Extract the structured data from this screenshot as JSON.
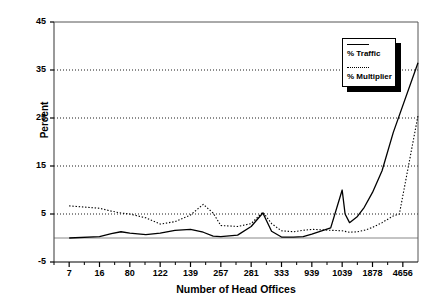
{
  "chart_data": {
    "type": "line",
    "title": "",
    "xlabel": "Number of Head Offices",
    "ylabel": "Percent",
    "ylim": [
      -5,
      45
    ],
    "yticks": [
      -5,
      5,
      15,
      25,
      35,
      45
    ],
    "grid": true,
    "grid_style": "dotted-horizontal",
    "legend_position": "top-right",
    "minor_ticks_per_interval": 2,
    "categories": [
      "7",
      "16",
      "80",
      "122",
      "139",
      "257",
      "281",
      "333",
      "939",
      "1039",
      "1878",
      "4656"
    ],
    "x_tick_labels": [
      "7",
      "16",
      "80",
      "122",
      "139",
      "257",
      "281",
      "333",
      "939",
      "1039",
      "1878",
      "4656"
    ],
    "series": [
      {
        "name": "% Traffic",
        "style": "solid",
        "color": "#000000",
        "x": [
          0,
          0.35,
          0.7,
          1.0,
          1.35,
          1.7,
          2.0,
          2.35,
          2.7,
          3.0,
          3.35,
          3.7,
          4.0,
          4.35,
          4.7,
          5.0,
          5.35,
          5.7,
          6.0,
          6.35,
          6.7,
          7.0,
          7.35,
          7.7,
          8.0,
          8.35,
          8.7,
          9.0,
          9.35,
          9.7,
          10.0,
          10.35,
          10.7,
          11.0,
          11.35
        ],
        "values": [
          0.0,
          0.0,
          0.1,
          0.2,
          0.5,
          0.8,
          1.0,
          1.2,
          1.3,
          1.1,
          0.8,
          0.6,
          0.9,
          1.3,
          1.6,
          1.8,
          1.4,
          0.9,
          0.5,
          0.2,
          0.2,
          0.4,
          1.6,
          4.3,
          5.3,
          1.4,
          0.2,
          0.2,
          0.2,
          0.4,
          0.9,
          1.4,
          2.0,
          2.4,
          2.6
        ]
      },
      {
        "name": "% Multiplier",
        "style": "dotted",
        "color": "#000000",
        "x": [
          0,
          0.35,
          0.7,
          1.0,
          1.35,
          1.7,
          2.0,
          2.35,
          2.7,
          3.0,
          3.35,
          3.7,
          4.0
        ],
        "values": [
          6.7,
          6.3,
          5.9,
          5.6,
          5.4,
          5.1,
          5.0,
          3.3,
          3.3,
          5.0,
          7.0,
          5.2,
          3.5
        ]
      }
    ],
    "traffic_points": [
      [
        7,
        0.0
      ],
      [
        16,
        0.3
      ],
      [
        30,
        0.9
      ],
      [
        50,
        1.3
      ],
      [
        80,
        1.0
      ],
      [
        100,
        0.7
      ],
      [
        122,
        1.0
      ],
      [
        130,
        1.6
      ],
      [
        139,
        1.8
      ],
      [
        180,
        1.2
      ],
      [
        220,
        0.4
      ],
      [
        257,
        0.3
      ],
      [
        270,
        0.6
      ],
      [
        281,
        2.4
      ],
      [
        300,
        5.2
      ],
      [
        315,
        1.4
      ],
      [
        333,
        0.2
      ],
      [
        500,
        0.2
      ],
      [
        700,
        0.3
      ],
      [
        939,
        0.8
      ],
      [
        1000,
        2.1
      ],
      [
        1039,
        10.0
      ],
      [
        1100,
        5.0
      ],
      [
        1200,
        3.2
      ],
      [
        1400,
        4.5
      ],
      [
        1600,
        6.4
      ],
      [
        1878,
        9.5
      ],
      [
        2500,
        14.0
      ],
      [
        3500,
        22.0
      ],
      [
        4656,
        36.5
      ]
    ],
    "multiplier_points": [
      [
        7,
        6.7
      ],
      [
        16,
        6.2
      ],
      [
        30,
        5.6
      ],
      [
        50,
        5.2
      ],
      [
        80,
        5.0
      ],
      [
        100,
        4.2
      ],
      [
        122,
        2.9
      ],
      [
        130,
        3.4
      ],
      [
        139,
        4.8
      ],
      [
        180,
        7.0
      ],
      [
        220,
        5.2
      ],
      [
        257,
        2.6
      ],
      [
        270,
        2.4
      ],
      [
        281,
        3.0
      ],
      [
        300,
        5.4
      ],
      [
        315,
        3.0
      ],
      [
        333,
        1.5
      ],
      [
        500,
        1.3
      ],
      [
        700,
        1.6
      ],
      [
        939,
        1.8
      ],
      [
        1039,
        1.5
      ],
      [
        1200,
        1.2
      ],
      [
        1400,
        1.3
      ],
      [
        1600,
        1.6
      ],
      [
        1878,
        2.2
      ],
      [
        2500,
        3.2
      ],
      [
        3500,
        4.6
      ],
      [
        4200,
        5.0
      ],
      [
        4656,
        25.5
      ]
    ],
    "legend": [
      {
        "label": "% Traffic",
        "style": "solid"
      },
      {
        "label": "% Multiplier",
        "style": "dotted"
      }
    ]
  }
}
